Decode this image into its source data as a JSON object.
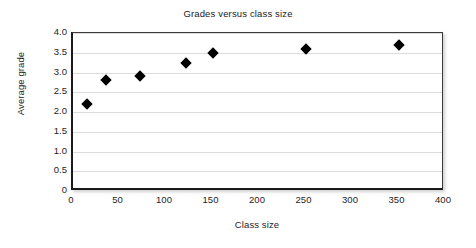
{
  "chart_data": {
    "type": "scatter",
    "title": "Grades versus class size",
    "xlabel": "Class size",
    "ylabel": "Average grade",
    "xlim": [
      0,
      400
    ],
    "ylim": [
      0,
      4.0
    ],
    "xticks": [
      "0",
      "50",
      "100",
      "150",
      "200",
      "250",
      "300",
      "350",
      "400"
    ],
    "xtick_values": [
      0,
      50,
      100,
      150,
      200,
      250,
      300,
      350,
      400
    ],
    "yticks": [
      "0",
      "0.5",
      "1.0",
      "1.5",
      "2.0",
      "2.5",
      "3.0",
      "3.5",
      "4.0"
    ],
    "ytick_values": [
      0,
      0.5,
      1.0,
      1.5,
      2.0,
      2.5,
      3.0,
      3.5,
      4.0
    ],
    "grid": "horizontal",
    "legend": null,
    "marker": "filled-diamond",
    "marker_color": "#000000",
    "series": [
      {
        "name": "Average grade",
        "points": [
          {
            "x": 15,
            "y": 2.2
          },
          {
            "x": 35,
            "y": 2.8
          },
          {
            "x": 72,
            "y": 2.9
          },
          {
            "x": 121,
            "y": 3.25
          },
          {
            "x": 150,
            "y": 3.5
          },
          {
            "x": 250,
            "y": 3.6
          },
          {
            "x": 350,
            "y": 3.7
          }
        ]
      }
    ]
  },
  "colors": {
    "background": "#ffffff",
    "axis": "#1c1a1a",
    "grid": "#dedbdb",
    "text": "#262323",
    "marker": "#000000"
  }
}
